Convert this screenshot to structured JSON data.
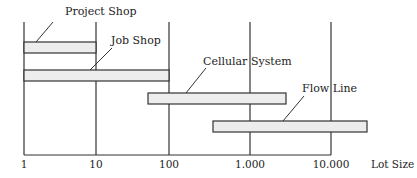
{
  "chart_data": {
    "type": "range-bar",
    "title": "",
    "xlabel": "Lot Size",
    "ylabel": "",
    "x_scale": "log",
    "x_ticks": [
      {
        "value": 1,
        "label": "1",
        "px": 24
      },
      {
        "value": 10,
        "label": "10",
        "px": 96
      },
      {
        "value": 100,
        "label": "100",
        "px": 169
      },
      {
        "value": 1000,
        "label": "1.000",
        "px": 250
      },
      {
        "value": 10000,
        "label": "10.000",
        "px": 331
      }
    ],
    "series": [
      {
        "name": "Project Shop",
        "range": [
          1,
          10
        ],
        "bar": {
          "x1": 24,
          "x2": 96,
          "y1": 42,
          "y2": 53
        },
        "label": {
          "x": 65,
          "y": 15
        },
        "leader": {
          "x1": 53,
          "y1": 22,
          "x2": 36,
          "y2": 42
        }
      },
      {
        "name": "Job Shop",
        "range": [
          1,
          100
        ],
        "bar": {
          "x1": 24,
          "x2": 169,
          "y1": 70,
          "y2": 81
        },
        "label": {
          "x": 111,
          "y": 44
        },
        "leader": {
          "x1": 112,
          "y1": 48,
          "x2": 90,
          "y2": 70
        }
      },
      {
        "name": "Cellular System",
        "range": [
          50,
          3000
        ],
        "bar": {
          "x1": 148,
          "x2": 286,
          "y1": 93,
          "y2": 104
        },
        "label": {
          "x": 203,
          "y": 65
        },
        "leader": {
          "x1": 206,
          "y1": 68,
          "x2": 186,
          "y2": 93
        }
      },
      {
        "name": "Flow Line",
        "range": [
          400,
          50000
        ],
        "bar": {
          "x1": 213,
          "x2": 367,
          "y1": 121,
          "y2": 132
        },
        "label": {
          "x": 302,
          "y": 92
        },
        "leader": {
          "x1": 304,
          "y1": 96,
          "x2": 283,
          "y2": 121
        }
      }
    ],
    "axis": {
      "baseline_y": 155,
      "grid_top_y": 22,
      "x_start": 24,
      "x_end": 331
    },
    "colors": {
      "bar_fill": "#ededed",
      "bar_stroke": "#333333",
      "line": "#333333",
      "text": "#222222"
    },
    "grid": "vertical lines at decades",
    "legend": "none (callout labels with leader lines)"
  }
}
